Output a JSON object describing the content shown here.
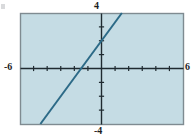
{
  "figure": {
    "title": "",
    "background_color": "#ffffff",
    "plot_background_color": "#c5dce4",
    "plot_border_color": "#7f8b91",
    "axis_color": "#1f2a30",
    "line_color": "#2c6a87"
  },
  "labels": {
    "top": "4",
    "bottom": "-4",
    "left": "-6",
    "right": "6"
  },
  "chart_data": {
    "type": "line",
    "title": "",
    "xlabel": "",
    "ylabel": "",
    "xlim": [
      -6,
      6
    ],
    "ylim": [
      -4,
      4
    ],
    "xtick_labels": [
      "-6",
      "6"
    ],
    "ytick_labels": [
      "4",
      "-4"
    ],
    "xticks": [
      -6,
      -5,
      -4,
      -3,
      -2,
      -1,
      0,
      1,
      2,
      3,
      4,
      5,
      6
    ],
    "yticks": [
      -4,
      -3,
      -2,
      -1,
      0,
      1,
      2,
      3,
      4
    ],
    "grid": false,
    "legend": "none",
    "series": [
      {
        "name": "line",
        "slope": 1.3333,
        "intercept": 2,
        "equation": "y = (4/3)x + 2",
        "x_intercept": -1.5,
        "y_intercept": 2,
        "x": [
          -4.5,
          1.5
        ],
        "values": [
          -4,
          4
        ]
      }
    ]
  }
}
